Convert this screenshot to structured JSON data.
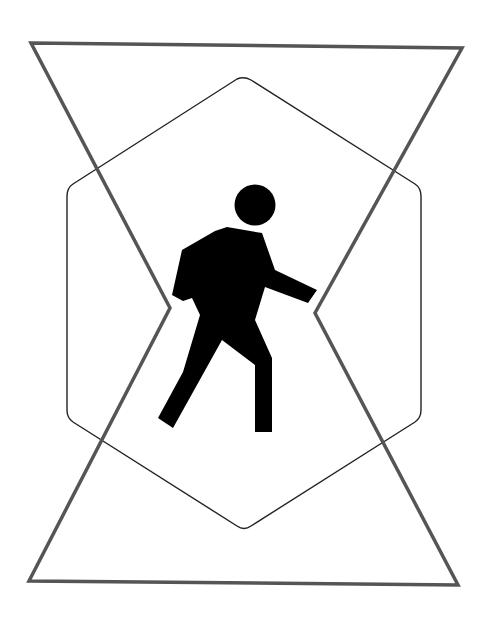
{
  "sign": {
    "description": "Pedestrian pictogram inside a hexagon, overlaid by an hourglass-shaped outline",
    "icon": "pedestrian-walking-icon",
    "colors": {
      "background": "#ffffff",
      "outer_outline": "#555555",
      "hexagon_outline": "#222222",
      "figure_fill": "#000000"
    }
  }
}
